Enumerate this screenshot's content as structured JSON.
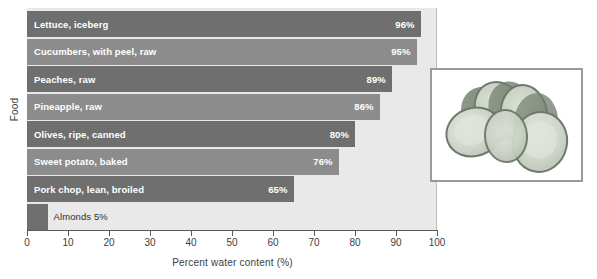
{
  "chart_data": {
    "type": "bar",
    "orientation": "horizontal",
    "title": "",
    "xlabel": "Percent water content (%)",
    "ylabel": "Food",
    "xlim": [
      0,
      100
    ],
    "xticks": [
      0,
      10,
      20,
      30,
      40,
      50,
      60,
      70,
      80,
      90,
      100
    ],
    "grid": false,
    "legend": false,
    "categories": [
      "Lettuce, iceberg",
      "Cucumbers, with peel, raw",
      "Peaches, raw",
      "Pineapple, raw",
      "Olives, ripe, canned",
      "Sweet potato, baked",
      "Pork chop, lean, broiled",
      "Almonds"
    ],
    "values": [
      96,
      95,
      89,
      86,
      80,
      76,
      65,
      5
    ],
    "value_labels": [
      "96%",
      "95%",
      "89%",
      "86%",
      "80%",
      "76%",
      "65%",
      "5%"
    ],
    "bars": [
      {
        "label": "Lettuce, iceberg",
        "value": 96,
        "value_label": "96%",
        "shade": "dark",
        "label_inside": true,
        "value_inside": true
      },
      {
        "label": "Cucumbers, with peel, raw",
        "value": 95,
        "value_label": "95%",
        "shade": "light",
        "label_inside": true,
        "value_inside": true
      },
      {
        "label": "Peaches, raw",
        "value": 89,
        "value_label": "89%",
        "shade": "dark",
        "label_inside": true,
        "value_inside": true
      },
      {
        "label": "Pineapple, raw",
        "value": 86,
        "value_label": "86%",
        "shade": "light",
        "label_inside": true,
        "value_inside": true
      },
      {
        "label": "Olives, ripe, canned",
        "value": 80,
        "value_label": "80%",
        "shade": "dark",
        "label_inside": true,
        "value_inside": true
      },
      {
        "label": "Sweet potato, baked",
        "value": 76,
        "value_label": "76%",
        "shade": "light",
        "label_inside": true,
        "value_inside": true
      },
      {
        "label": "Pork chop, lean, broiled",
        "value": 65,
        "value_label": "65%",
        "shade": "dark",
        "label_inside": true,
        "value_inside": true
      },
      {
        "label": "Almonds",
        "value": 5,
        "value_label": "5%",
        "shade": "dark",
        "label_inside": false,
        "value_inside": false,
        "outside_label": "Almonds 5%"
      }
    ],
    "colors": {
      "bar_dark": "#6f6f6f",
      "bar_light": "#8c8c8c",
      "plot_background": "#e9e9e9",
      "axis": "#5a5a5a",
      "bar_text": "#ffffff",
      "outside_text": "#2f2f2f",
      "page_background": "#ffffff"
    }
  },
  "inset": {
    "name": "cucumber-slices-photo",
    "border_color": "#9a9a9a"
  }
}
